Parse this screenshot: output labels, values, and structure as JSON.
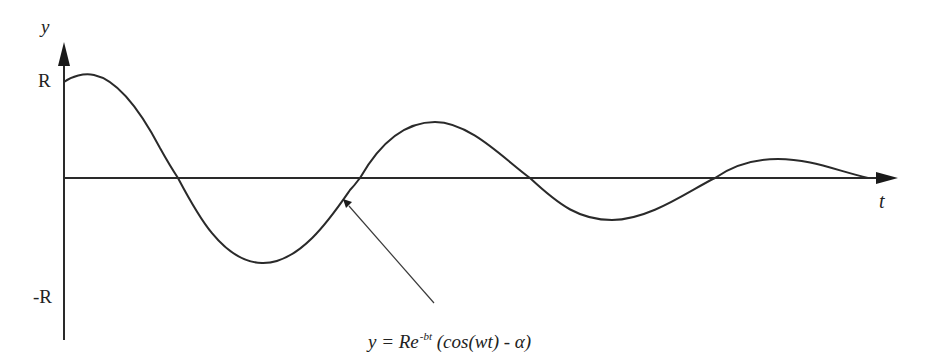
{
  "diagram": {
    "type": "damped-oscillation",
    "y_axis_label": "y",
    "x_axis_label": "t",
    "tick_labels": {
      "top": "R",
      "bottom": "-R"
    },
    "equation": {
      "lhs": "y = Re",
      "exponent": "-bt",
      "rhs": " (cos(wt) - α)"
    },
    "annotation": "arrow pointing from equation to curve",
    "colors": {
      "stroke": "#2a2a2a",
      "background": "#ffffff"
    }
  }
}
